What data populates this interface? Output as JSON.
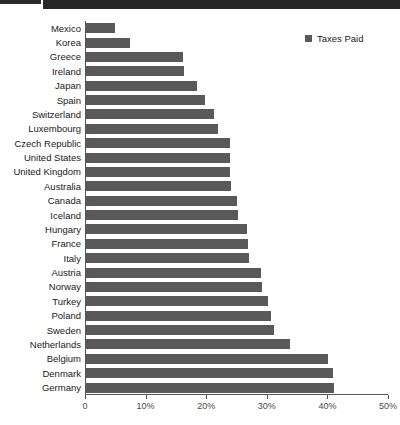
{
  "header": {
    "strip_color": "#262626"
  },
  "legend": {
    "position": "top-right",
    "entries": [
      {
        "label": "Taxes Paid",
        "color": "#595959",
        "marker": "square-marker-icon"
      }
    ]
  },
  "axis": {
    "x_ticks": [
      "0",
      "10%",
      "20%",
      "30%",
      "40%",
      "50%"
    ],
    "x_tick_values": [
      0,
      10,
      20,
      30,
      40,
      50
    ]
  },
  "chart_data": {
    "type": "bar",
    "orientation": "horizontal",
    "title": "",
    "subtitle": "",
    "xlabel": "",
    "ylabel": "",
    "xlim": [
      0,
      50
    ],
    "grid": false,
    "legend_position": "top-right",
    "series": [
      {
        "name": "Taxes Paid",
        "color": "#595959",
        "values": [
          4.8,
          7.3,
          16.0,
          16.1,
          18.3,
          19.7,
          21.2,
          21.8,
          23.7,
          23.8,
          23.8,
          23.9,
          24.9,
          25.1,
          26.6,
          26.7,
          26.9,
          28.8,
          29.0,
          30.0,
          30.6,
          31.0,
          33.6,
          40.0,
          40.8,
          41.0
        ]
      }
    ],
    "categories": [
      "Mexico",
      "Korea",
      "Greece",
      "Ireland",
      "Japan",
      "Spain",
      "Switzerland",
      "Luxembourg",
      "Czech Republic",
      "United States",
      "United Kingdom",
      "Australia",
      "Canada",
      "Iceland",
      "Hungary",
      "France",
      "Italy",
      "Austria",
      "Norway",
      "Turkey",
      "Poland",
      "Sweden",
      "Netherlands",
      "Belgium",
      "Denmark",
      "Germany"
    ]
  }
}
